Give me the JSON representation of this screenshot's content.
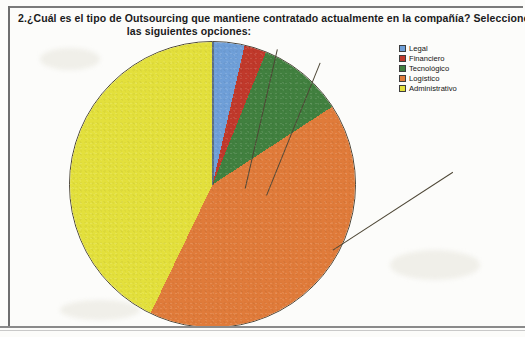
{
  "question": {
    "number": "2.",
    "line_1": "2.¿Cuál es el tipo de Outsourcing que mantiene contratado actualmente en la compañía? Seleccione una d",
    "line_2": "las siguientes opciones:"
  },
  "legend": {
    "items": [
      {
        "label": "Legal",
        "color": "#6f9fd8"
      },
      {
        "label": "Financiero",
        "color": "#c0392b"
      },
      {
        "label": "Tecnológico",
        "color": "#41803f"
      },
      {
        "label": "Logístico",
        "color": "#e07b3a"
      },
      {
        "label": "Administrativo",
        "color": "#e3e03c"
      }
    ]
  },
  "chart_data": {
    "type": "pie",
    "title": "2.¿Cuál es el tipo de Outsourcing que mantiene contratado actualmente en la compañía? Seleccione una d las siguientes opciones:",
    "xlabel": "",
    "ylabel": "",
    "legend_position": "right",
    "grid": false,
    "start_angle_deg": 0,
    "direction": "clockwise",
    "categories": [
      "Legal",
      "Financiero",
      "Tecnológico",
      "Logístico",
      "Administrativo"
    ],
    "values": [
      3.6,
      2.5,
      9.7,
      41.3,
      42.9
    ],
    "series": [
      {
        "name": "Tipo de Outsourcing",
        "values": [
          3.6,
          2.5,
          9.7,
          41.3,
          42.9
        ]
      }
    ],
    "slices": [
      {
        "label": "Legal",
        "percent": 3.6,
        "start_deg": 0.0,
        "end_deg": 13.0,
        "color": "#6f9fd8"
      },
      {
        "label": "Financiero",
        "percent": 2.5,
        "start_deg": 13.0,
        "end_deg": 22.0,
        "color": "#c0392b"
      },
      {
        "label": "Tecnológico",
        "percent": 9.7,
        "start_deg": 22.0,
        "end_deg": 57.0,
        "color": "#41803f"
      },
      {
        "label": "Logístico",
        "percent": 41.3,
        "start_deg": 57.0,
        "end_deg": 205.7,
        "color": "#e07b3a"
      },
      {
        "label": "Administrativo",
        "percent": 42.9,
        "start_deg": 205.7,
        "end_deg": 360.0,
        "color": "#e3e03c"
      }
    ]
  }
}
